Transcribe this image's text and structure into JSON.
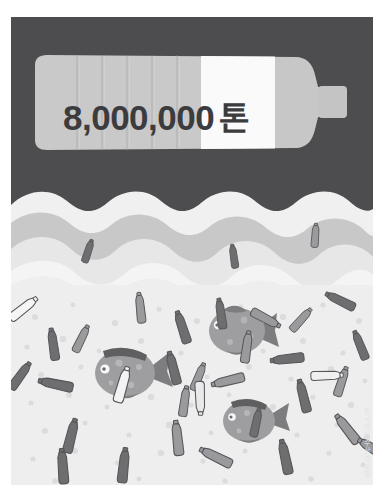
{
  "poster": {
    "headline_number": "8,000,000",
    "headline_unit": "톤",
    "watermark": "한국해양수산개발원"
  },
  "colors": {
    "background_sky": "#4d4d50",
    "bottle_body": "#c9c9c9",
    "bottle_rib_shadow": "#bdbdbd",
    "bottle_label_white": "#fafafa",
    "bottle_cap": "#c2c2c2",
    "wave_light": "#f0f0f0",
    "wave_mid": "#c8c8c8",
    "wave_pale": "#e3e3e3",
    "water": "#eeeeee",
    "bubble": "#e0e0e0",
    "litter_dark": "#6e6e70",
    "litter_mid": "#9a9a9c",
    "litter_light": "#f5f5f5",
    "litter_outline": "#55555a",
    "fish_body": "#9e9ea0",
    "fish_dark": "#7d7d80",
    "text_dark": "#3c3c3e"
  },
  "scene": {
    "sky_band": {
      "x": 0,
      "y": 0,
      "width": 362,
      "height": 190
    },
    "hero_bottle": {
      "name": "hero-plastic-bottle",
      "orientation": "horizontal",
      "rib_count": 6,
      "label_band": {
        "x": 190,
        "width": 74
      }
    },
    "waves": [
      {
        "name": "wave-crest-far",
        "color": "#f0f0f0"
      },
      {
        "name": "wave-band-mid",
        "color": "#c8c8c8"
      },
      {
        "name": "wave-crest-near",
        "color": "#e9e9e9"
      },
      {
        "name": "wave-foam-front",
        "color": "#f4f4f4"
      }
    ],
    "fish": [
      {
        "name": "fish-upper-right",
        "facing": "left",
        "cx": 231,
        "cy": 315
      },
      {
        "name": "fish-mid-left",
        "facing": "right",
        "cx": 116,
        "cy": 356
      },
      {
        "name": "fish-lower-center",
        "facing": "right",
        "cx": 239,
        "cy": 404
      }
    ],
    "floating_bottles_on_waves": [
      {
        "name": "bottle-wave-left",
        "x": 82,
        "y": 238
      },
      {
        "name": "bottle-wave-center",
        "x": 222,
        "y": 243
      },
      {
        "name": "bottle-wave-right",
        "x": 306,
        "y": 225
      }
    ],
    "underwater_bottles_count": 26,
    "bubbles_count": 58
  }
}
